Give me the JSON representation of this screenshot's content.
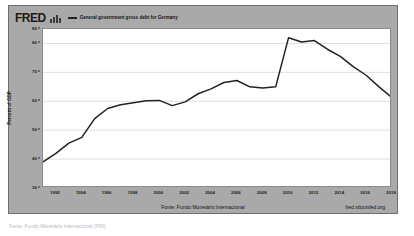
{
  "header": {
    "logo_text": "FRED",
    "logo_icon": "bar-chart-icon",
    "legend_label": "General government gross debt for Germany"
  },
  "footer": {
    "source_note": "Fonte: Fundo Monetário Internacional",
    "url": "fred.stlouisfed.org"
  },
  "caption": "Fonte: Fundo Monetário Internacional (FMI)",
  "colors": {
    "card_background": "#a9a9a9",
    "plot_background": "#ffffff",
    "line": "#222222",
    "grid": "#d8d8d8",
    "text": "#1d1d1d"
  },
  "chart_data": {
    "type": "line",
    "title": "General government gross debt for Germany",
    "xlabel": "",
    "ylabel": "Percent of GDP",
    "xlim": [
      1991,
      2018
    ],
    "ylim": [
      30,
      85
    ],
    "grid": true,
    "legend_position": "top",
    "ytick_values": [
      85,
      80,
      70,
      60,
      50,
      40,
      30
    ],
    "ytick_labels": [
      "85",
      "80",
      "70",
      "60",
      "50",
      "40",
      "30"
    ],
    "gridline_values": [
      80,
      70,
      60,
      50,
      40
    ],
    "xtick_values": [
      1992,
      1994,
      1996,
      1998,
      2000,
      2002,
      2004,
      2006,
      2008,
      2010,
      2012,
      2014,
      2016,
      2018
    ],
    "xtick_labels": [
      "1992",
      "1994",
      "1996",
      "1998",
      "2000",
      "2002",
      "2004",
      "2006",
      "2008",
      "2010",
      "2012",
      "2014",
      "2016",
      "2018"
    ],
    "series": [
      {
        "name": "General government gross debt for Germany",
        "color": "#222222",
        "x": [
          1991,
          1992,
          1993,
          1994,
          1995,
          1996,
          1997,
          1998,
          1999,
          2000,
          2001,
          2002,
          2003,
          2004,
          2005,
          2006,
          2007,
          2008,
          2009,
          2010,
          2011,
          2012,
          2013,
          2014,
          2015,
          2016,
          2017,
          2018
        ],
        "values": [
          39.0,
          42.0,
          45.5,
          47.5,
          54.0,
          57.5,
          58.8,
          59.5,
          60.2,
          60.3,
          58.5,
          59.8,
          62.6,
          64.3,
          66.5,
          67.2,
          65.0,
          64.6,
          65.0,
          82.0,
          80.5,
          81.0,
          78.0,
          75.5,
          72.0,
          69.0,
          65.0,
          61.2
        ]
      }
    ]
  }
}
